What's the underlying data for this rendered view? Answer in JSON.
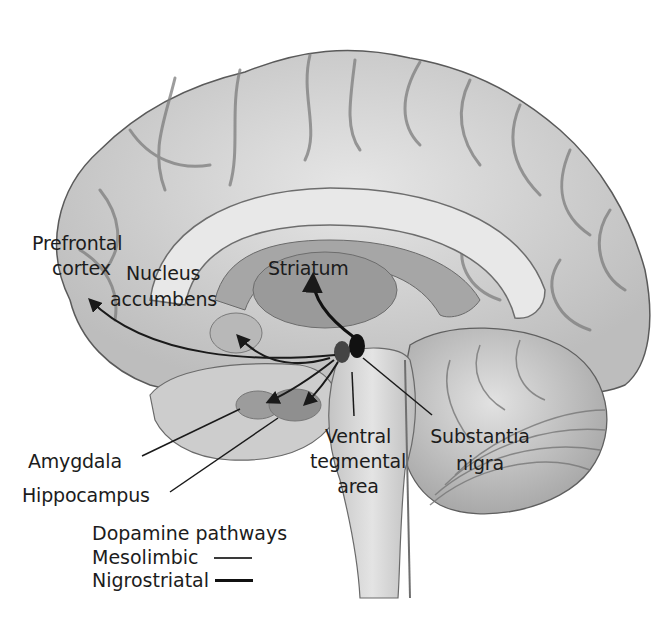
{
  "figure": {
    "labels": {
      "prefrontal_cortex": [
        "Prefrontal",
        "cortex"
      ],
      "nucleus_accumbens": [
        "Nucleus",
        "accumbens"
      ],
      "striatum": "Striatum",
      "amygdala": "Amygdala",
      "hippocampus": "Hippocampus",
      "ventral_tegmental_area": [
        "Ventral",
        "tegmental",
        "area"
      ],
      "substantia_nigra": [
        "Substantia",
        "nigra"
      ]
    },
    "legend": {
      "title": "Dopamine pathways",
      "items": [
        {
          "label": "Mesolimbic",
          "line": "thin"
        },
        {
          "label": "Nigrostriatal",
          "line": "thick"
        }
      ]
    },
    "colors": {
      "background": "#ffffff",
      "brain_fill": "#d9d9d9",
      "brain_outline": "#5a5a5a",
      "sulci": "#7d7d7d",
      "deep_structures": "#9c9c9c",
      "pathway_arrows": "#1a1a1a",
      "label_text": "#1c1c1c"
    }
  }
}
